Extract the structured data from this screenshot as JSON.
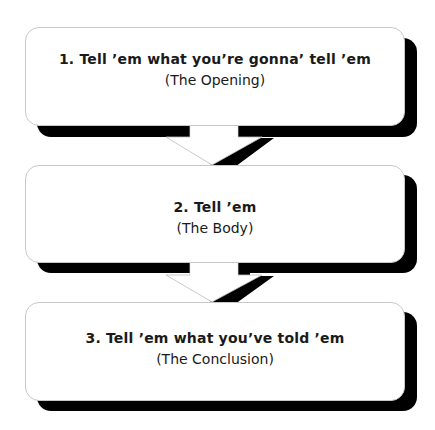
{
  "diagram": {
    "type": "vertical-flow",
    "steps": [
      {
        "title": "1. Tell ’em what you’re gonna’ tell ’em",
        "subtitle": "(The Opening)"
      },
      {
        "title": "2. Tell ’em",
        "subtitle": "(The Body)"
      },
      {
        "title": "3. Tell ’em what you’ve told ’em",
        "subtitle": "(The Conclusion)"
      }
    ],
    "connectors": [
      {
        "from": 1,
        "to": 2,
        "icon": "arrow-down-icon"
      },
      {
        "from": 2,
        "to": 3,
        "icon": "arrow-down-icon"
      }
    ],
    "colors": {
      "box_fill": "#ffffff",
      "box_border": "#c8c8c8",
      "shadow": "#000000",
      "text": "#1a1a1a"
    }
  }
}
